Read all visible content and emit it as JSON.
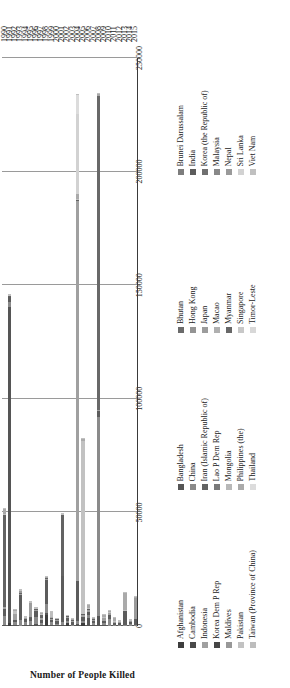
{
  "chart_data": {
    "type": "bar",
    "subtype": "stacked-horizontal",
    "title": "",
    "xlabel": "",
    "ylabel": "Number of People Killed",
    "ylim": [
      0,
      250000
    ],
    "yticks": [
      "0",
      "50000",
      "100000",
      "150000",
      "200000",
      "250000"
    ],
    "ytick_values": [
      0,
      50000,
      100000,
      150000,
      200000,
      250000
    ],
    "grid": true,
    "legend_position": "bottom",
    "orientation": "rotated-90-ccw",
    "categories": [
      "1990",
      "1991",
      "1992",
      "1993",
      "1994",
      "1995",
      "1996",
      "1997",
      "1998",
      "1999",
      "2000",
      "2001",
      "2002",
      "2003",
      "2004",
      "2005",
      "2006",
      "2007",
      "2008",
      "2009",
      "2010",
      "2011",
      "2012",
      "2013",
      "2014",
      "2015"
    ],
    "series": [
      {
        "name": "Afghanistan",
        "color": "#3d3d3d",
        "values": [
          0,
          1200,
          150,
          60,
          80,
          0,
          120,
          80,
          4700,
          50,
          130,
          0,
          1200,
          0,
          0,
          1500,
          50,
          0,
          0,
          80,
          0,
          0,
          80,
          0,
          150,
          120
        ]
      },
      {
        "name": "Bangladesh",
        "color": "#555555",
        "values": [
          600,
          139000,
          230,
          0,
          400,
          660,
          700,
          560,
          1050,
          300,
          180,
          450,
          0,
          0,
          900,
          0,
          3600,
          400,
          4200,
          350,
          70,
          160,
          0,
          0,
          0,
          0
        ]
      },
      {
        "name": "Bhutan",
        "color": "#6b6b6b",
        "values": [
          0,
          0,
          0,
          0,
          0,
          0,
          0,
          0,
          0,
          0,
          0,
          0,
          0,
          0,
          0,
          0,
          0,
          0,
          0,
          11,
          0,
          0,
          0,
          0,
          0,
          0
        ]
      },
      {
        "name": "Brunei Darussalam",
        "color": "#7d7d7d",
        "values": [
          0,
          0,
          0,
          0,
          0,
          0,
          0,
          0,
          0,
          0,
          0,
          0,
          0,
          0,
          0,
          0,
          0,
          0,
          0,
          0,
          0,
          0,
          0,
          0,
          0,
          0
        ]
      },
      {
        "name": "Cambodia",
        "color": "#4a4a4a",
        "values": [
          0,
          0,
          0,
          0,
          0,
          0,
          0,
          0,
          0,
          0,
          0,
          0,
          0,
          0,
          0,
          0,
          0,
          0,
          0,
          0,
          0,
          0,
          0,
          0,
          0,
          0
        ]
      },
      {
        "name": "China",
        "color": "#8a8a8a",
        "values": [
          4000,
          2200,
          1200,
          2800,
          1500,
          1450,
          3200,
          700,
          4150,
          1300,
          700,
          1400,
          1100,
          500,
          1100,
          900,
          1400,
          900,
          88000,
          780,
          3000,
          400,
          450,
          300,
          700,
          180
        ]
      },
      {
        "name": "Hong Kong",
        "color": "#949494",
        "values": [
          0,
          0,
          0,
          0,
          0,
          0,
          0,
          0,
          0,
          0,
          0,
          0,
          0,
          0,
          0,
          0,
          0,
          0,
          0,
          0,
          0,
          0,
          0,
          0,
          0,
          0
        ]
      },
      {
        "name": "India",
        "color": "#5c5c5c",
        "values": [
          3000,
          2300,
          1000,
          11000,
          1100,
          1300,
          2800,
          1300,
          10500,
          1200,
          1200,
          20100,
          1200,
          1400,
          18000,
          1500,
          1200,
          1100,
          2500,
          1100,
          1900,
          900,
          1000,
          6100,
          900,
          2700
        ]
      },
      {
        "name": "Indonesia",
        "color": "#a0a0a0",
        "values": [
          800,
          300,
          2600,
          400,
          300,
          200,
          400,
          800,
          300,
          300,
          500,
          250,
          300,
          400,
          167000,
          900,
          1000,
          400,
          300,
          1200,
          600,
          200,
          300,
          200,
          150,
          200
        ]
      },
      {
        "name": "Iran (Islamic Republic of)",
        "color": "#636363",
        "values": [
          40500,
          200,
          260,
          300,
          200,
          150,
          300,
          1600,
          300,
          200,
          200,
          26800,
          400,
          300,
          300,
          700,
          400,
          200,
          300,
          200,
          200,
          150,
          100,
          100,
          100,
          100
        ]
      },
      {
        "name": "Japan",
        "color": "#9c9c9c",
        "values": [
          0,
          0,
          0,
          200,
          0,
          6400,
          0,
          0,
          0,
          0,
          0,
          0,
          0,
          0,
          0,
          0,
          0,
          0,
          0,
          0,
          0,
          0,
          0,
          0,
          0,
          0
        ]
      },
      {
        "name": "Korea (the Republic of)",
        "color": "#707070",
        "values": [
          0,
          0,
          0,
          0,
          0,
          0,
          0,
          0,
          0,
          0,
          0,
          0,
          0,
          0,
          0,
          0,
          0,
          0,
          0,
          0,
          0,
          0,
          0,
          0,
          0,
          0
        ]
      },
      {
        "name": "Korea Dem P Rep",
        "color": "#464646",
        "values": [
          0,
          0,
          0,
          0,
          0,
          0,
          0,
          0,
          0,
          0,
          0,
          0,
          0,
          0,
          0,
          0,
          0,
          0,
          0,
          0,
          0,
          0,
          0,
          0,
          0,
          0
        ]
      },
      {
        "name": "Lao P Dem Rep",
        "color": "#7a7a7a",
        "values": [
          0,
          0,
          0,
          0,
          0,
          0,
          0,
          0,
          0,
          0,
          0,
          0,
          0,
          0,
          0,
          0,
          0,
          0,
          0,
          0,
          0,
          0,
          0,
          0,
          0,
          0
        ]
      },
      {
        "name": "Macao",
        "color": "#b0b0b0",
        "values": [
          0,
          0,
          0,
          0,
          0,
          0,
          0,
          0,
          0,
          0,
          0,
          0,
          0,
          0,
          0,
          0,
          0,
          0,
          0,
          0,
          0,
          0,
          0,
          0,
          0,
          0
        ]
      },
      {
        "name": "Malaysia",
        "color": "#888888",
        "values": [
          0,
          0,
          0,
          0,
          0,
          0,
          0,
          0,
          0,
          0,
          0,
          0,
          0,
          0,
          0,
          0,
          0,
          0,
          0,
          0,
          0,
          0,
          0,
          0,
          0,
          0
        ]
      },
      {
        "name": "Maldives",
        "color": "#989898",
        "values": [
          0,
          0,
          0,
          0,
          0,
          0,
          0,
          0,
          0,
          0,
          0,
          0,
          0,
          0,
          100,
          0,
          0,
          0,
          0,
          0,
          0,
          0,
          0,
          0,
          0,
          0
        ]
      },
      {
        "name": "Mongolia",
        "color": "#b8b8b8",
        "values": [
          0,
          0,
          0,
          0,
          0,
          0,
          0,
          0,
          0,
          0,
          0,
          0,
          0,
          0,
          0,
          0,
          0,
          0,
          0,
          0,
          0,
          0,
          0,
          0,
          0,
          0
        ]
      },
      {
        "name": "Myanmar",
        "color": "#686868",
        "values": [
          0,
          0,
          0,
          0,
          0,
          0,
          0,
          0,
          0,
          0,
          0,
          0,
          0,
          0,
          0,
          0,
          0,
          0,
          138000,
          0,
          0,
          0,
          0,
          0,
          0,
          0
        ]
      },
      {
        "name": "Nepal",
        "color": "#9a9a9a",
        "values": [
          0,
          0,
          0,
          700,
          0,
          0,
          0,
          0,
          0,
          0,
          0,
          0,
          0,
          0,
          0,
          0,
          0,
          0,
          0,
          0,
          0,
          0,
          0,
          0,
          400,
          9000
        ]
      },
      {
        "name": "Pakistan",
        "color": "#c2c2c2",
        "values": [
          200,
          400,
          1400,
          300,
          300,
          300,
          300,
          300,
          200,
          300,
          200,
          200,
          200,
          200,
          600,
          76000,
          200,
          200,
          200,
          200,
          500,
          200,
          200,
          300,
          200,
          200
        ]
      },
      {
        "name": "Philippines (the)",
        "color": "#aaaaaa",
        "values": [
          2500,
          300,
          200,
          300,
          200,
          200,
          200,
          200,
          300,
          200,
          200,
          200,
          200,
          200,
          2000,
          800,
          1200,
          300,
          800,
          1100,
          200,
          1600,
          200,
          7350,
          200,
          200
        ]
      },
      {
        "name": "Singapore",
        "color": "#c8c8c8",
        "values": [
          0,
          0,
          0,
          0,
          0,
          0,
          0,
          0,
          0,
          0,
          0,
          0,
          0,
          0,
          0,
          0,
          0,
          0,
          0,
          0,
          0,
          0,
          0,
          0,
          0,
          0
        ]
      },
      {
        "name": "Sri Lanka",
        "color": "#d2d2d2",
        "values": [
          0,
          0,
          0,
          0,
          0,
          0,
          0,
          0,
          0,
          0,
          0,
          0,
          0,
          0,
          35400,
          0,
          0,
          0,
          0,
          0,
          0,
          0,
          0,
          0,
          0,
          0
        ]
      },
      {
        "name": "Taiwan (Province of China)",
        "color": "#bdbdbd",
        "values": [
          0,
          0,
          0,
          0,
          0,
          0,
          0,
          0,
          0,
          2400,
          0,
          0,
          0,
          0,
          0,
          0,
          0,
          0,
          0,
          0,
          0,
          0,
          0,
          0,
          0,
          0
        ]
      },
      {
        "name": "Thailand",
        "color": "#dcdcdc",
        "values": [
          0,
          0,
          0,
          0,
          0,
          0,
          0,
          0,
          0,
          0,
          0,
          0,
          0,
          0,
          8350,
          0,
          0,
          0,
          0,
          0,
          0,
          0,
          0,
          0,
          0,
          0
        ]
      },
      {
        "name": "Timor-Leste",
        "color": "#d8d8d8",
        "values": [
          0,
          0,
          0,
          0,
          0,
          0,
          0,
          0,
          0,
          0,
          0,
          0,
          0,
          0,
          0,
          0,
          0,
          0,
          0,
          0,
          0,
          0,
          0,
          0,
          0,
          0
        ]
      },
      {
        "name": "Viet Nam",
        "color": "#c0c0c0",
        "values": [
          400,
          200,
          200,
          200,
          200,
          200,
          200,
          200,
          400,
          200,
          200,
          200,
          200,
          200,
          200,
          200,
          200,
          200,
          200,
          200,
          200,
          200,
          200,
          200,
          200,
          200
        ]
      }
    ]
  },
  "axis": {
    "y_title": "Number of People Killed",
    "y_ticks": [
      "250000",
      "200000",
      "150000",
      "100000",
      "50000",
      "0"
    ],
    "x_ticks": [
      "1990",
      "1991",
      "1992",
      "1993",
      "1994",
      "1995",
      "1996",
      "1997",
      "1998",
      "1999",
      "2000",
      "2001",
      "2002",
      "2003",
      "2004",
      "2005",
      "2006",
      "2007",
      "2008",
      "2009",
      "2010",
      "2011",
      "2012",
      "2013",
      "2014",
      "2015"
    ]
  },
  "legend": {
    "columns": [
      {
        "items": [
          {
            "label": "Afghanistan",
            "color": "#3d3d3d"
          },
          {
            "label": "Cambodia",
            "color": "#4a4a4a"
          },
          {
            "label": "Indonesia",
            "color": "#a0a0a0"
          },
          {
            "label": "Korea Dem P Rep",
            "color": "#464646"
          },
          {
            "label": "Maldives",
            "color": "#989898"
          },
          {
            "label": "Pakistan",
            "color": "#c2c2c2"
          },
          {
            "label": "Taiwan (Province of China)",
            "color": "#bdbdbd"
          }
        ]
      },
      {
        "items": [
          {
            "label": "Bangladesh",
            "color": "#555555"
          },
          {
            "label": "China",
            "color": "#8a8a8a"
          },
          {
            "label": "Iran (Islamic Republic of)",
            "color": "#636363"
          },
          {
            "label": "Lao P Dem Rep",
            "color": "#7a7a7a"
          },
          {
            "label": "Mongolia",
            "color": "#b8b8b8"
          },
          {
            "label": "Philippines (the)",
            "color": "#aaaaaa"
          },
          {
            "label": "Thailand",
            "color": "#dcdcdc"
          }
        ]
      },
      {
        "items": [
          {
            "label": "Bhutan",
            "color": "#6b6b6b"
          },
          {
            "label": "Hong Kong",
            "color": "#949494"
          },
          {
            "label": "Japan",
            "color": "#9c9c9c"
          },
          {
            "label": "Macao",
            "color": "#b0b0b0"
          },
          {
            "label": "Myanmar",
            "color": "#686868"
          },
          {
            "label": "Singapore",
            "color": "#c8c8c8"
          },
          {
            "label": "Timor-Leste",
            "color": "#d8d8d8"
          }
        ]
      },
      {
        "items": [
          {
            "label": "Brunei Darussalam",
            "color": "#7d7d7d"
          },
          {
            "label": "India",
            "color": "#5c5c5c"
          },
          {
            "label": "Korea (the Republic of)",
            "color": "#707070"
          },
          {
            "label": "Malaysia",
            "color": "#888888"
          },
          {
            "label": "Nepal",
            "color": "#9a9a9a"
          },
          {
            "label": "Sri Lanka",
            "color": "#d2d2d2"
          },
          {
            "label": "Viet Nam",
            "color": "#c0c0c0"
          }
        ]
      }
    ]
  }
}
